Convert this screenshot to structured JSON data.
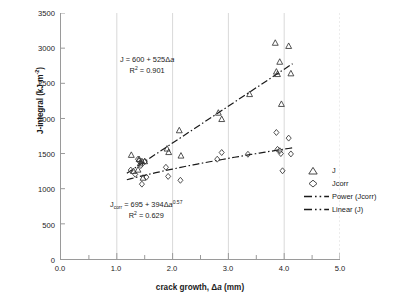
{
  "chart_data": {
    "type": "scatter",
    "title": "",
    "xlabel": "crack growth, Δa  (mm)",
    "ylabel": "J-integral (kJ·m⁻²)",
    "xlim": [
      0,
      5
    ],
    "ylim": [
      0,
      3500
    ],
    "xticks": [
      "0.0",
      "1.0",
      "2.0",
      "3.0",
      "4.0",
      "5.0"
    ],
    "xtick_values": [
      0,
      1,
      2,
      3,
      4,
      5
    ],
    "yticks": [
      "0",
      "500",
      "1000",
      "1500",
      "2000",
      "2500",
      "3000",
      "3500"
    ],
    "ytick_values": [
      0,
      500,
      1000,
      1500,
      2000,
      2500,
      3000,
      3500
    ],
    "grid": "vertical-only",
    "legend_position": "right-outside",
    "series": [
      {
        "name": "J",
        "marker": "triangle",
        "points": [
          [
            1.26,
            1480
          ],
          [
            1.3,
            1250
          ],
          [
            1.38,
            1270
          ],
          [
            1.4,
            1420
          ],
          [
            1.42,
            1360
          ],
          [
            1.45,
            1390
          ],
          [
            1.47,
            1155
          ],
          [
            1.5,
            1390
          ],
          [
            1.9,
            1570
          ],
          [
            1.93,
            1520
          ],
          [
            2.12,
            1830
          ],
          [
            2.15,
            1470
          ],
          [
            2.82,
            2080
          ],
          [
            2.88,
            1990
          ],
          [
            3.38,
            2345
          ],
          [
            3.84,
            3075
          ],
          [
            3.86,
            2665
          ],
          [
            3.88,
            2630
          ],
          [
            3.92,
            2805
          ],
          [
            3.95,
            2205
          ],
          [
            4.08,
            3030
          ],
          [
            4.12,
            2640
          ]
        ]
      },
      {
        "name": "Jcorr",
        "marker": "diamond",
        "points": [
          [
            1.25,
            1265
          ],
          [
            1.33,
            1205
          ],
          [
            1.38,
            1420
          ],
          [
            1.4,
            1395
          ],
          [
            1.43,
            1330
          ],
          [
            1.45,
            1065
          ],
          [
            1.5,
            1385
          ],
          [
            1.53,
            1165
          ],
          [
            1.88,
            1305
          ],
          [
            1.92,
            1175
          ],
          [
            2.14,
            1120
          ],
          [
            2.8,
            1420
          ],
          [
            2.88,
            1515
          ],
          [
            3.35,
            1490
          ],
          [
            3.86,
            1800
          ],
          [
            3.88,
            1560
          ],
          [
            3.92,
            1540
          ],
          [
            3.94,
            1500
          ],
          [
            3.97,
            1255
          ],
          [
            4.08,
            1720
          ],
          [
            4.12,
            1495
          ]
        ]
      }
    ],
    "trendlines": [
      {
        "name": "Linear (J)",
        "equation_text": "J = 600 + 525Δa",
        "r2_text": "R² = 0.901",
        "r2_value": 0.901,
        "intercept": 600,
        "slope": 525,
        "style": "dash-dot"
      },
      {
        "name": "Power (Jcorr)",
        "equation_text": "Jcorr = 695 + 394Δa^0.57",
        "r2_text": "R² = 0.629",
        "r2_value": 0.629,
        "intercept": 695,
        "coefficient": 394,
        "exponent": 0.57,
        "style": "dash-dot"
      }
    ]
  },
  "axes": {
    "ylabel_main": "J-integral (kJ·m",
    "ylabel_exp": "-2",
    "ylabel_close": ")",
    "xlabel_pre": "crack growth, Δ",
    "xlabel_ital": "a",
    "xlabel_post": "  (mm)"
  },
  "annotations": {
    "linear": {
      "line1_pre": "J = 600 + 525",
      "line1_delta": "Δ",
      "line1_ital": "a",
      "line2_r": "R",
      "line2_sup": "2",
      "line2_val": " = 0.901"
    },
    "power": {
      "line1_j": "J",
      "line1_sub": "corr",
      "line1_mid": " = 695 + 394",
      "line1_delta": "Δ",
      "line1_ital": "a",
      "line1_exp": "0.57",
      "line2_r": "R",
      "line2_sup": "2",
      "line2_val": " = 0.629"
    }
  },
  "legend": {
    "items": [
      {
        "label": "J",
        "key": "triangle"
      },
      {
        "label": "Jcorr",
        "key": "diamond"
      },
      {
        "label": "Power (Jcorr)",
        "key": "dashdot"
      },
      {
        "label": "Linear (J)",
        "key": "dashdot"
      }
    ]
  },
  "colors": {
    "axis": "#9a9a9a",
    "grid": "#d9d9d9",
    "marker": "#333333",
    "trendline": "#1a1a1a",
    "text": "#1a1a1a"
  }
}
